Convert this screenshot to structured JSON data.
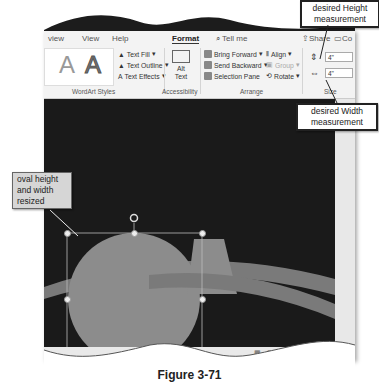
{
  "ribbon": {
    "tabs": [
      "view",
      "View",
      "Help",
      "Format"
    ],
    "active_tab": "Format",
    "tell_me": "Tell me",
    "share": "Share",
    "comments": "Co",
    "wordart_styles": {
      "label": "WordArt Styles",
      "text_fill": "Text Fill",
      "text_outline": "Text Outline",
      "text_effects": "Text Effects",
      "sample_a": "A"
    },
    "accessibility": {
      "label": "Accessibility",
      "alt_text_line1": "Alt",
      "alt_text_line2": "Text"
    },
    "arrange": {
      "label": "Arrange",
      "bring_forward": "Bring Forward",
      "send_backward": "Send Backward",
      "selection_pane": "Selection Pane",
      "align": "Align",
      "group": "Group",
      "rotate": "Rotate"
    },
    "size": {
      "label": "Size",
      "height": "4\"",
      "width": "4\""
    }
  },
  "callouts": {
    "height": "desired Height measurement",
    "width": "desired Width measurement",
    "oval": "oval height and width resized"
  },
  "caption": "Figure 3-71",
  "colors": {
    "slide_bg": "#1a1a1a",
    "shape_fill": "#8c8c8c",
    "ribbon_bg": "#f3f3f3"
  }
}
